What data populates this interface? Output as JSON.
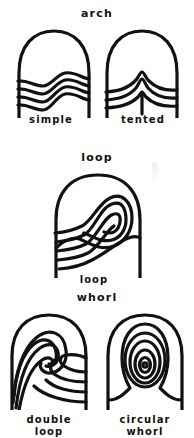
{
  "figure": {
    "title_implied": "Fingerprint pattern types",
    "background_color": "#ffffff",
    "ink_color": "#111111"
  },
  "groups": [
    {
      "id": "arch",
      "title": "arch",
      "specimens": [
        {
          "id": "simple",
          "caption": "simple",
          "pattern": "simple-arch"
        },
        {
          "id": "tented",
          "caption": "tented",
          "pattern": "tented-arch"
        }
      ]
    },
    {
      "id": "loop",
      "title": "loop",
      "specimens": [
        {
          "id": "loop",
          "caption": "loop",
          "pattern": "loop"
        }
      ]
    },
    {
      "id": "whorl",
      "title": "whorl",
      "specimens": [
        {
          "id": "double-loop",
          "caption": "double\nloop",
          "pattern": "double-loop-whorl"
        },
        {
          "id": "circular",
          "caption": "circular\nwhorl",
          "pattern": "circular-whorl"
        }
      ]
    }
  ]
}
